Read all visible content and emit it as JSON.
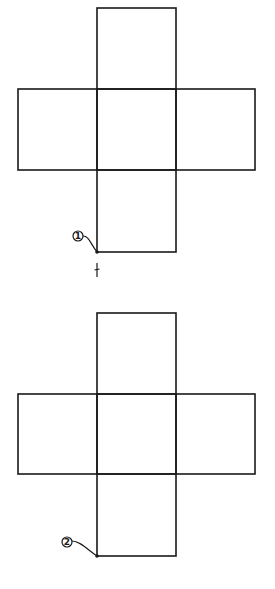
{
  "diagram": {
    "type": "cube-net",
    "colors": {
      "stroke": "#1a1a1a",
      "background": "#ffffff"
    },
    "nets": [
      {
        "id": "net-1",
        "label": "1",
        "faces": [
          {
            "name": "top",
            "x": 97,
            "y": 8,
            "w": 79,
            "h": 81
          },
          {
            "name": "left",
            "x": 18,
            "y": 89,
            "w": 79,
            "h": 81
          },
          {
            "name": "center",
            "x": 97,
            "y": 89,
            "w": 79,
            "h": 81
          },
          {
            "name": "right",
            "x": 176,
            "y": 89,
            "w": 79,
            "h": 81
          },
          {
            "name": "bottom",
            "x": 97,
            "y": 170,
            "w": 79,
            "h": 82
          }
        ],
        "marker": {
          "x": 78,
          "y": 236,
          "target_x": 97,
          "target_y": 252
        },
        "tick": true
      },
      {
        "id": "net-2",
        "label": "2",
        "faces": [
          {
            "name": "top",
            "x": 97,
            "y": 313,
            "w": 79,
            "h": 81
          },
          {
            "name": "left",
            "x": 18,
            "y": 394,
            "w": 79,
            "h": 80
          },
          {
            "name": "center",
            "x": 97,
            "y": 394,
            "w": 79,
            "h": 80
          },
          {
            "name": "right",
            "x": 176,
            "y": 394,
            "w": 79,
            "h": 80
          },
          {
            "name": "bottom",
            "x": 97,
            "y": 474,
            "w": 79,
            "h": 82
          }
        ],
        "marker": {
          "x": 67,
          "y": 542,
          "target_x": 97,
          "target_y": 556
        },
        "tick": false
      }
    ]
  }
}
